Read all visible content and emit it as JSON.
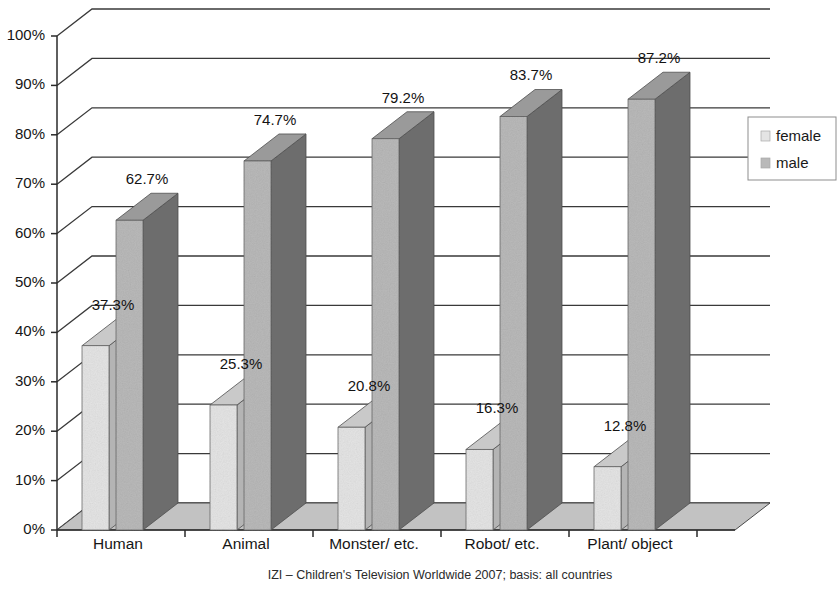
{
  "chart_data": {
    "type": "bar",
    "title": "",
    "subtitle": "",
    "xlabel": "",
    "ylabel": "",
    "categories": [
      "Human",
      "Animal",
      "Monster/ etc.",
      "Robot/ etc.",
      "Plant/ object"
    ],
    "series": [
      {
        "name": "female",
        "values": [
          37.3,
          25.3,
          20.8,
          16.3,
          12.8
        ],
        "labels": [
          "37.3%",
          "25.3%",
          "20.8%",
          "16.3%",
          "12.8%"
        ],
        "color": "#e4e4e4",
        "side_color": "#b4b4b4",
        "top_color": "#c9c9c9"
      },
      {
        "name": "male",
        "values": [
          62.7,
          74.7,
          79.2,
          83.7,
          87.2
        ],
        "labels": [
          "62.7%",
          "74.7%",
          "79.2%",
          "83.7%",
          "87.2%"
        ],
        "color": "#b9b9b9",
        "side_color": "#6d6d6d",
        "top_color": "#9a9a9a"
      }
    ],
    "ylim": [
      0,
      100
    ],
    "ytick_values": [
      0,
      10,
      20,
      30,
      40,
      50,
      60,
      70,
      80,
      90,
      100
    ],
    "ytick_labels": [
      "0%",
      "10%",
      "20%",
      "30%",
      "40%",
      "50%",
      "60%",
      "70%",
      "80%",
      "90%",
      "100%"
    ],
    "grid": true,
    "grid_axis": "y",
    "legend_position": "right",
    "three_d": true,
    "annotation": "IZI – Children's Television Worldwide 2007; basis: all countries"
  },
  "legend": {
    "items": [
      {
        "label": "female",
        "swatch": "#e4e4e4"
      },
      {
        "label": "male",
        "swatch": "#b9b9b9"
      }
    ]
  },
  "caption": {
    "text": "IZI – Children's Television Worldwide 2007; basis: all countries"
  },
  "axis": {
    "y_labels": [
      "100%",
      "90%",
      "80%",
      "70%",
      "60%",
      "50%",
      "40%",
      "30%",
      "20%",
      "10%",
      "0%"
    ],
    "x_labels": [
      "Human",
      "Animal",
      "Monster/ etc.",
      "Robot/ etc.",
      "Plant/ object"
    ]
  },
  "colors": {
    "background": "#ffffff",
    "axis_line": "#2a2a2a",
    "grid_line": "#3a3a3a",
    "floor": "#c2c2c2",
    "text": "#161616"
  }
}
